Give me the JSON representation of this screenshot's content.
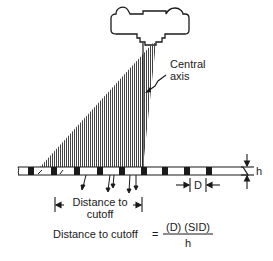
{
  "diagram": {
    "type": "grid-cutoff",
    "labels": {
      "central_axis_line1": "Central",
      "central_axis_line2": "axis",
      "distance_line1": "Distance to",
      "distance_line2": "cutoff",
      "d_label": "D",
      "h_label": "h"
    },
    "formula": {
      "lhs": "Distance to cutoff",
      "equals": "=",
      "numerator": "(D) (SID)",
      "denominator": "h"
    },
    "colors": {
      "line": "#1a1a1a",
      "beam_hatch": "#555555",
      "background": "#ffffff"
    }
  }
}
